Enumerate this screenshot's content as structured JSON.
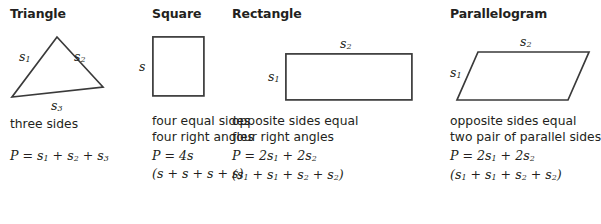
{
  "columns": [
    {
      "title": "Triangle",
      "shape": "triangle",
      "labels": [
        {
          "name": "side-1",
          "text": "s",
          "sub": "1"
        },
        {
          "name": "side-2",
          "text": "s",
          "sub": "2"
        },
        {
          "name": "side-3",
          "text": "s",
          "sub": "3"
        }
      ],
      "description": [
        "three sides"
      ],
      "formulas": [
        {
          "lead": "P = s",
          "sub1": "1",
          "mid1": " + s",
          "sub2": "2",
          "mid2": " + s",
          "sub3": "3",
          "tail": ""
        }
      ],
      "formula_text": [
        "P = s1 + s2 + s3"
      ]
    },
    {
      "title": "Square",
      "shape": "square",
      "labels": [
        {
          "name": "side-s",
          "text": "s",
          "sub": ""
        }
      ],
      "description": [
        "four equal sides",
        "four right angles"
      ],
      "formula_text": [
        "P = 4s",
        "(s + s + s + s)"
      ]
    },
    {
      "title": "Rectangle",
      "shape": "rectangle",
      "labels": [
        {
          "name": "side-1",
          "text": "s",
          "sub": "1"
        },
        {
          "name": "side-2",
          "text": "s",
          "sub": "2"
        }
      ],
      "description": [
        "opposite sides equal",
        "four right angles"
      ],
      "formula_text": [
        "P = 2s1 + 2s2",
        "(s1 + s1 + s2 + s2)"
      ]
    },
    {
      "title": "Parallelogram",
      "shape": "parallelogram",
      "labels": [
        {
          "name": "side-1",
          "text": "s",
          "sub": "1"
        },
        {
          "name": "side-2",
          "text": "s",
          "sub": "2"
        }
      ],
      "description": [
        "opposite sides equal",
        "two pair of parallel sides"
      ],
      "formula_text": [
        "P = 2s1 + 2s2",
        "(s1 + s1 + s2 + s2)"
      ]
    }
  ],
  "colors": {
    "background": "#ffffff",
    "ink": "#231f20",
    "stroke": "#3a3a3a"
  }
}
